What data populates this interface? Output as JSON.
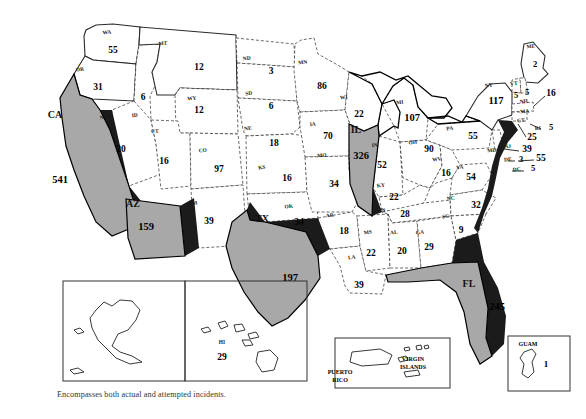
{
  "figure": {
    "type": "choropleth-map",
    "region": "United States and Territories",
    "footnote": "Encompasses both actual and attempted incidents.",
    "highlight_color": "#a8a8a8",
    "base_color": "#ffffff",
    "highlighted_states": [
      "CA",
      "AZ",
      "TX",
      "IL",
      "FL"
    ]
  },
  "chart_data": {
    "type": "map",
    "title": "",
    "value_label": "incidents",
    "states": [
      {
        "abbr": "WA",
        "value": 55,
        "x": 113,
        "y": 53,
        "ax": 107,
        "ay": 34,
        "highlight": false
      },
      {
        "abbr": "OR",
        "value": 31,
        "x": 98,
        "y": 90,
        "ax": 80,
        "ay": 71,
        "highlight": false
      },
      {
        "abbr": "CA",
        "value": 541,
        "x": 60,
        "y": 183,
        "ax": 55,
        "ay": 118,
        "highlight": true
      },
      {
        "abbr": "NV",
        "value": 20,
        "x": 121,
        "y": 152,
        "ax": 104,
        "ay": 119,
        "highlight": false
      },
      {
        "abbr": "ID",
        "value": 6,
        "x": 143,
        "y": 100,
        "ax": 135,
        "ay": 117,
        "highlight": false
      },
      {
        "abbr": "MT",
        "value": 12,
        "x": 199,
        "y": 70,
        "ax": 163,
        "ay": 45,
        "highlight": false
      },
      {
        "abbr": "WY",
        "value": 12,
        "x": 199,
        "y": 113,
        "ax": 192,
        "ay": 100,
        "highlight": false
      },
      {
        "abbr": "UT",
        "value": 16,
        "x": 164,
        "y": 164,
        "ax": 155,
        "ay": 133,
        "highlight": false
      },
      {
        "abbr": "AZ",
        "value": 159,
        "x": 146,
        "y": 230,
        "ax": 133,
        "ay": 207,
        "highlight": true
      },
      {
        "abbr": "CO",
        "value": 97,
        "x": 219,
        "y": 172,
        "ax": 203,
        "ay": 152,
        "highlight": false
      },
      {
        "abbr": "NM",
        "value": 39,
        "x": 209,
        "y": 224,
        "ax": 193,
        "ay": 205,
        "highlight": false
      },
      {
        "abbr": "ND",
        "value": 3,
        "x": 271,
        "y": 74,
        "ax": 247,
        "ay": 60,
        "highlight": false
      },
      {
        "abbr": "SD",
        "value": 6,
        "x": 271,
        "y": 109,
        "ax": 249,
        "ay": 95,
        "highlight": false
      },
      {
        "abbr": "NE",
        "value": 18,
        "x": 274,
        "y": 146,
        "ax": 248,
        "ay": 130,
        "highlight": false
      },
      {
        "abbr": "KS",
        "value": 16,
        "x": 287,
        "y": 181,
        "ax": 262,
        "ay": 169,
        "highlight": false
      },
      {
        "abbr": "OK",
        "value": 34,
        "x": 299,
        "y": 225,
        "ax": 289,
        "ay": 208,
        "highlight": false
      },
      {
        "abbr": "TX",
        "value": 197,
        "x": 290,
        "y": 281,
        "ax": 262,
        "ay": 222,
        "highlight": true
      },
      {
        "abbr": "MN",
        "value": 86,
        "x": 322,
        "y": 89,
        "ax": 303,
        "ay": 64,
        "highlight": false
      },
      {
        "abbr": "IA",
        "value": 70,
        "x": 328,
        "y": 139,
        "ax": 313,
        "ay": 126,
        "highlight": false
      },
      {
        "abbr": "MO",
        "value": 34,
        "x": 334,
        "y": 187,
        "ax": 322,
        "ay": 157,
        "highlight": false
      },
      {
        "abbr": "AR",
        "value": 18,
        "x": 344,
        "y": 234,
        "ax": 330,
        "ay": 217,
        "highlight": false
      },
      {
        "abbr": "LA",
        "value": 39,
        "x": 359,
        "y": 288,
        "ax": 352,
        "ay": 259,
        "highlight": false
      },
      {
        "abbr": "WI",
        "value": 22,
        "x": 359,
        "y": 117,
        "ax": 344,
        "ay": 99,
        "highlight": false
      },
      {
        "abbr": "IL",
        "value": 326,
        "x": 361,
        "y": 159,
        "ax": 356,
        "ay": 133,
        "highlight": true
      },
      {
        "abbr": "MS",
        "value": 22,
        "x": 371,
        "y": 256,
        "ax": 368,
        "ay": 234,
        "highlight": false
      },
      {
        "abbr": "MI",
        "value": 107,
        "x": 412,
        "y": 121,
        "ax": 400,
        "ay": 104,
        "highlight": false
      },
      {
        "abbr": "IN",
        "value": 52,
        "x": 382,
        "y": 168,
        "ax": 375,
        "ay": 147,
        "highlight": false
      },
      {
        "abbr": "KY",
        "value": 22,
        "x": 394,
        "y": 200,
        "ax": 381,
        "ay": 187,
        "highlight": false
      },
      {
        "abbr": "TN",
        "value": 28,
        "x": 405,
        "y": 217,
        "ax": 382,
        "ay": 212,
        "highlight": false
      },
      {
        "abbr": "AL",
        "value": 20,
        "x": 402,
        "y": 254,
        "ax": 394,
        "ay": 234,
        "highlight": false
      },
      {
        "abbr": "OH",
        "value": 90,
        "x": 429,
        "y": 152,
        "ax": 413,
        "ay": 144,
        "highlight": false
      },
      {
        "abbr": "GA",
        "value": 29,
        "x": 429,
        "y": 250,
        "ax": 420,
        "ay": 234,
        "highlight": false
      },
      {
        "abbr": "FL",
        "value": 245,
        "x": 497,
        "y": 310,
        "ax": 469,
        "ay": 287,
        "highlight": true
      },
      {
        "abbr": "WV",
        "value": 16,
        "x": 446,
        "y": 176,
        "ax": 437,
        "ay": 161,
        "highlight": false
      },
      {
        "abbr": "VA",
        "value": 54,
        "x": 471,
        "y": 180,
        "ax": 460,
        "ay": 169,
        "highlight": false
      },
      {
        "abbr": "NC",
        "value": 32,
        "x": 476,
        "y": 208,
        "ax": 451,
        "ay": 200,
        "highlight": false
      },
      {
        "abbr": "SC",
        "value": 9,
        "x": 461,
        "y": 233,
        "ax": 446,
        "ay": 218,
        "highlight": false
      },
      {
        "abbr": "PA",
        "value": 55,
        "x": 473,
        "y": 139,
        "ax": 450,
        "ay": 130,
        "highlight": false
      },
      {
        "abbr": "NY",
        "value": 117,
        "x": 496,
        "y": 104,
        "ax": 489,
        "ay": 87,
        "highlight": false
      },
      {
        "abbr": "ME",
        "value": 2,
        "x": 535,
        "y": 67,
        "ax": 531,
        "ay": 48,
        "highlight": false
      },
      {
        "abbr": "VT",
        "value": 5,
        "x": 516,
        "y": 98,
        "ax": 514,
        "ay": 85,
        "highlight": false
      },
      {
        "abbr": "NH",
        "value": 5,
        "x": 527,
        "y": 95,
        "ax": 524,
        "ay": 103,
        "highlight": false
      },
      {
        "abbr": "MA",
        "value": 16,
        "x": 551,
        "y": 96,
        "ax": 525,
        "ay": 113,
        "highlight": false
      },
      {
        "abbr": "RI",
        "value": 5,
        "x": 551,
        "y": 130,
        "ax": 538,
        "ay": 130,
        "highlight": false
      },
      {
        "abbr": "CT",
        "value": 25,
        "x": 532,
        "y": 140,
        "ax": 521,
        "ay": 122,
        "highlight": false
      },
      {
        "abbr": "NJ",
        "value": 39,
        "x": 527,
        "y": 152,
        "ax": 508,
        "ay": 148,
        "highlight": false
      },
      {
        "abbr": "DE",
        "value": 3,
        "x": 521,
        "y": 162,
        "ax": 508,
        "ay": 161,
        "highlight": false
      },
      {
        "abbr": "MD",
        "value": 55,
        "x": 541,
        "y": 161,
        "ax": 492,
        "ay": 152,
        "highlight": false
      },
      {
        "abbr": "DC",
        "value": 5,
        "x": 533,
        "y": 171,
        "ax": 517,
        "ay": 171,
        "highlight": false
      }
    ],
    "insets": [
      {
        "name": "AK",
        "label": "AK",
        "value": 5,
        "box": [
          63,
          281,
          122,
          100
        ]
      },
      {
        "name": "HI",
        "label": "HI",
        "value": 29,
        "box": [
          185,
          281,
          122,
          100
        ]
      }
    ],
    "territories": [
      {
        "name": "PUERTO RICO",
        "value": 30,
        "box": [
          335,
          338,
          115,
          50
        ]
      },
      {
        "name": "VIRGIN ISLANDS",
        "value": null,
        "box": null
      },
      {
        "name": "GUAM",
        "value": 1,
        "box": [
          508,
          336,
          62,
          55
        ]
      }
    ]
  }
}
